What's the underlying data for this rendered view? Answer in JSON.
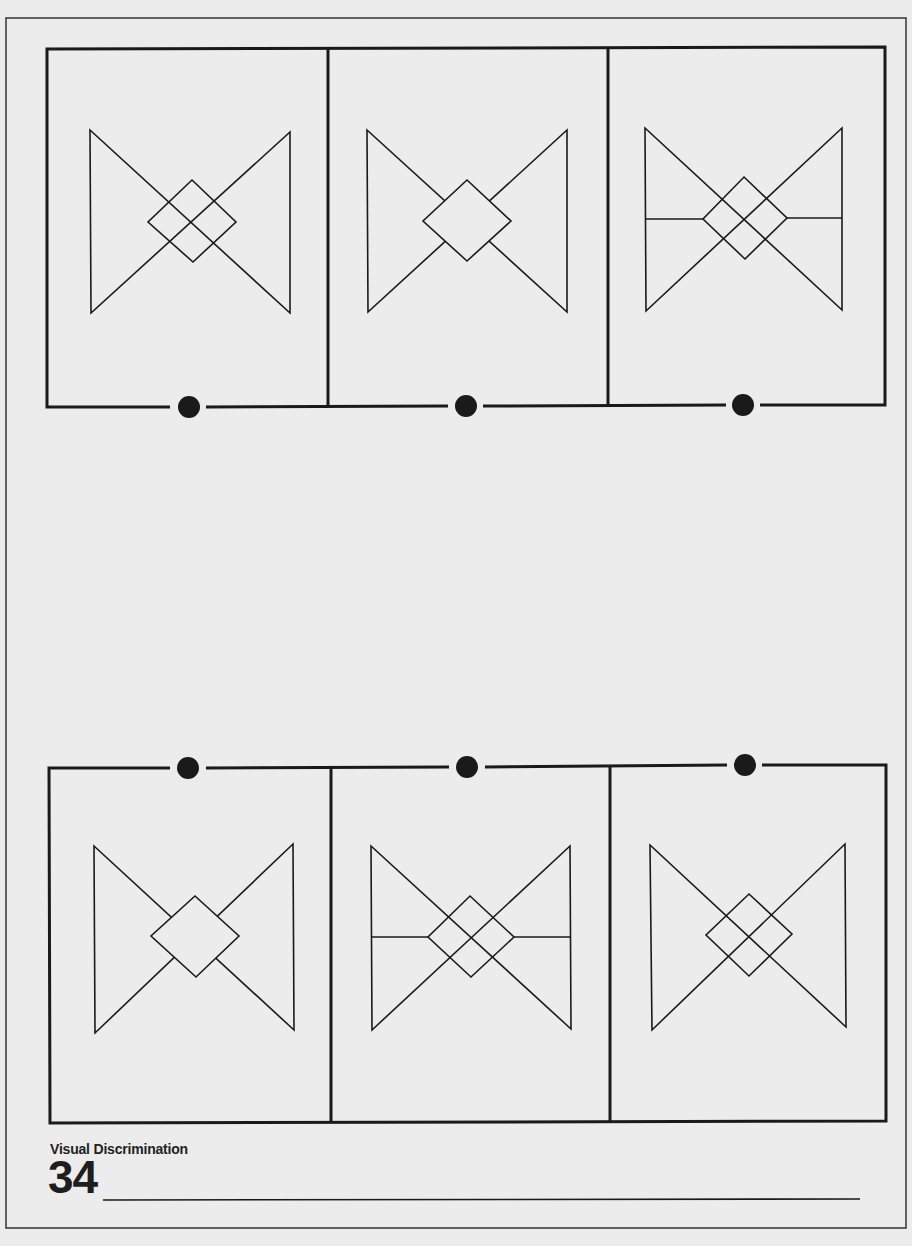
{
  "worksheet": {
    "caption": "Visual Discrimination",
    "page_number": "34",
    "colors": {
      "paper": "#ececec",
      "ink": "#1a1a1a",
      "fill": "#ececec"
    }
  },
  "rows": [
    {
      "position": "top",
      "connector_side": "bottom",
      "panels": [
        {
          "id": "top-1",
          "figure": "bowtie",
          "diamond": "transparent",
          "horizontal_bar": false
        },
        {
          "id": "top-2",
          "figure": "bowtie",
          "diamond": "opaque",
          "horizontal_bar": false
        },
        {
          "id": "top-3",
          "figure": "bowtie",
          "diamond": "transparent",
          "horizontal_bar": true
        }
      ]
    },
    {
      "position": "bottom",
      "connector_side": "top",
      "panels": [
        {
          "id": "bottom-1",
          "figure": "bowtie",
          "diamond": "opaque",
          "horizontal_bar": false
        },
        {
          "id": "bottom-2",
          "figure": "bowtie",
          "diamond": "transparent",
          "horizontal_bar": true
        },
        {
          "id": "bottom-3",
          "figure": "bowtie",
          "diamond": "transparent",
          "horizontal_bar": false
        }
      ]
    }
  ],
  "answer_line": {
    "present": true
  }
}
